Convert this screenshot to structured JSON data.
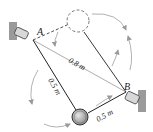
{
  "diagram": {
    "points": {
      "A": {
        "label": "A"
      },
      "B": {
        "label": "B"
      }
    },
    "dimensions": {
      "AB": "0.8 m",
      "A_sphere": "0.5 m",
      "sphere_B": "0.5 m"
    },
    "colors": {
      "line": "#222222",
      "guide": "#888888",
      "wall": "#9a9a9a",
      "sphere": "#b8b8b8",
      "arrow": "#9a9a9a"
    }
  }
}
